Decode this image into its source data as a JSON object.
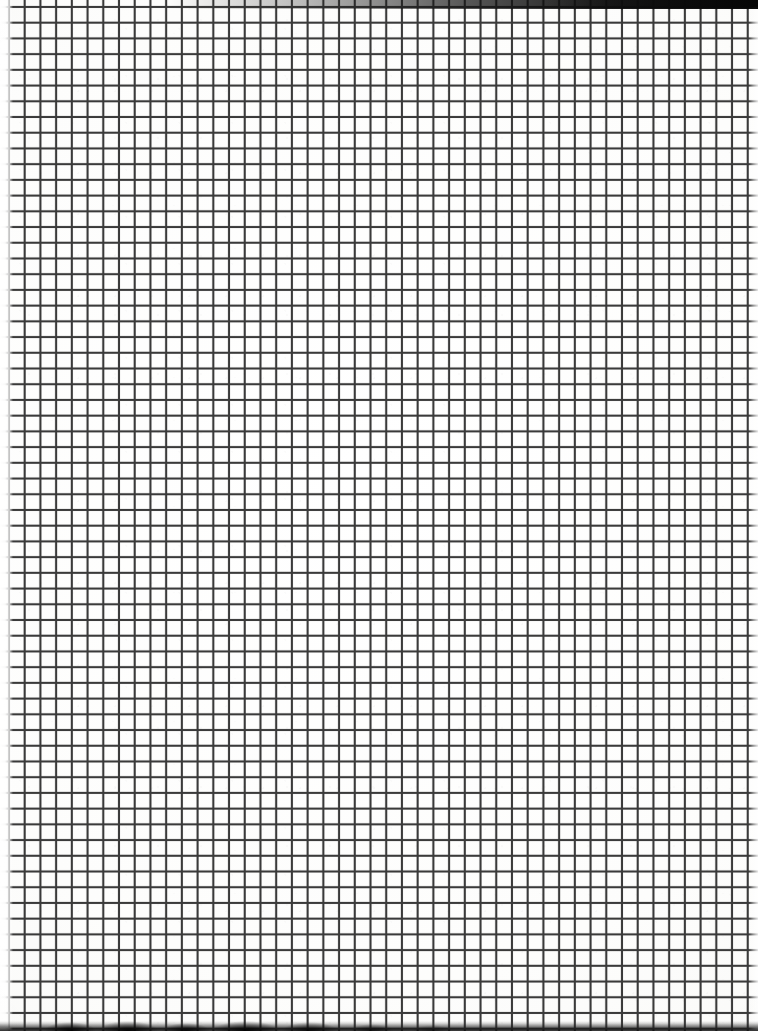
{
  "image": {
    "subject": "scanned sheet of blank square-ruled graph paper",
    "width_px": 758,
    "height_px": 1031,
    "text_content": "",
    "visible_labels": []
  },
  "paper": {
    "background_color": "#fdfdfc",
    "tone": "near-white, very slightly warm",
    "surface": "matte grid / quadrille notebook page",
    "handwriting": "none",
    "printed_text": "none"
  },
  "grid": {
    "pattern": "uniform square grid",
    "line_color": "#3a3a3a",
    "line_weight_px": 1.7,
    "cell_pitch_px": 15.72,
    "cell_shape": "square",
    "emphasis_lines": "none — all rules are the same weight",
    "vertical_line_count": 48,
    "horizontal_line_count": 65,
    "first_vertical_line_x_px": 8,
    "first_horizontal_line_y_px": 6
  },
  "scan_artifacts": {
    "top_edge": {
      "name": "black scan band",
      "position": "top, strongest toward the right corner",
      "height_px": 8,
      "color": "#0a0a0a"
    },
    "bottom_edge": {
      "name": "dark irregular shadow band",
      "position": "bottom, strongest toward the left",
      "height_px": 9,
      "color": "#121212"
    },
    "left_edge": {
      "name": "faded page edge",
      "width_px": 12,
      "description": "rules fade out into white at the sheet margin"
    },
    "right_edge": {
      "name": "light page margin",
      "width_px": 9
    },
    "grain": "faint paper speckle across the sheet"
  }
}
